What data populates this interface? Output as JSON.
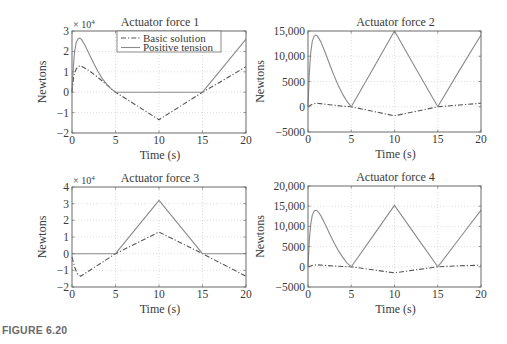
{
  "figure": {
    "caption": "FIGURE 6.20"
  },
  "chart_data": [
    {
      "type": "line",
      "title": "Actuator force 1",
      "xlabel": "Time (s)",
      "ylabel": "Newtons",
      "xlim": [
        0,
        20
      ],
      "ylim": [
        -20000,
        30000
      ],
      "y_multiplier": "× 10^4",
      "xticks": [
        0,
        5,
        10,
        15,
        20
      ],
      "yticks": [
        -2,
        -1,
        0,
        1,
        2,
        3
      ],
      "ytick_labels": [
        "−2",
        "−1",
        "0",
        "1",
        "2",
        "3"
      ],
      "grid": true,
      "legend": {
        "position": "top-right",
        "entries": [
          "Basic solution",
          "Positive tension"
        ]
      },
      "box": {
        "left": 72,
        "right": 246,
        "top": 31,
        "bottom": 133
      },
      "series": [
        {
          "name": "Basic solution",
          "style": "dashdot",
          "x": [
            0,
            0.2,
            0.5,
            0.8,
            1.0,
            2,
            3,
            4,
            5,
            7.5,
            10,
            12.5,
            15,
            17.5,
            20
          ],
          "y": [
            0,
            8000,
            11500,
            12800,
            13000,
            10500,
            7200,
            3600,
            0,
            -6700,
            -13500,
            -6700,
            0,
            6200,
            12500
          ]
        },
        {
          "name": "Positive tension",
          "style": "solid",
          "x": [
            0,
            0.15,
            0.3,
            0.5,
            0.7,
            0.9,
            1.1,
            1.5,
            2,
            2.5,
            3,
            3.5,
            4,
            4.5,
            5,
            10,
            15,
            17.5,
            20
          ],
          "y": [
            0,
            12000,
            20000,
            24500,
            26200,
            26500,
            25800,
            23000,
            18500,
            14000,
            10000,
            6500,
            3800,
            1600,
            0,
            0,
            0,
            13000,
            26000
          ]
        }
      ]
    },
    {
      "type": "line",
      "title": "Actuator force 2",
      "xlabel": "Time (s)",
      "ylabel": "Newtons",
      "xlim": [
        0,
        20
      ],
      "ylim": [
        -5000,
        15000
      ],
      "xticks": [
        0,
        5,
        10,
        15,
        20
      ],
      "yticks": [
        -5000,
        0,
        5000,
        10000,
        15000
      ],
      "ytick_labels": [
        "−5000",
        "0",
        "5000",
        "10,000",
        "15,000"
      ],
      "grid": true,
      "box": {
        "left": 308,
        "right": 481,
        "top": 31,
        "bottom": 132
      },
      "series": [
        {
          "name": "Basic solution",
          "style": "dashdot",
          "x": [
            0,
            0.5,
            1,
            2,
            3,
            4,
            5,
            7.5,
            10,
            12.5,
            15,
            17.5,
            20
          ],
          "y": [
            0,
            500,
            700,
            500,
            300,
            100,
            0,
            -900,
            -1800,
            -900,
            0,
            350,
            700
          ]
        },
        {
          "name": "Positive tension",
          "style": "solid",
          "x": [
            0,
            0.15,
            0.3,
            0.5,
            0.7,
            0.9,
            1.1,
            1.5,
            2,
            2.5,
            3,
            3.5,
            4,
            4.5,
            5,
            7.5,
            10,
            12.5,
            15,
            17.5,
            20
          ],
          "y": [
            0,
            6500,
            10500,
            13000,
            14000,
            14200,
            14000,
            12800,
            10700,
            8400,
            6200,
            4200,
            2500,
            1100,
            0,
            7500,
            15000,
            7500,
            0,
            7200,
            14200
          ]
        }
      ]
    },
    {
      "type": "line",
      "title": "Actuator force 3",
      "xlabel": "Time (s)",
      "ylabel": "Newtons",
      "xlim": [
        0,
        20
      ],
      "ylim": [
        -20000,
        40000
      ],
      "y_multiplier": "× 10^4",
      "xticks": [
        0,
        5,
        10,
        15,
        20
      ],
      "yticks": [
        -2,
        -1,
        0,
        1,
        2,
        3,
        4
      ],
      "ytick_labels": [
        "−2",
        "−1",
        "0",
        "1",
        "2",
        "3",
        "4"
      ],
      "grid": true,
      "box": {
        "left": 72,
        "right": 246,
        "top": 187,
        "bottom": 287
      },
      "series": [
        {
          "name": "Basic solution",
          "style": "dashdot",
          "x": [
            0,
            0.3,
            0.6,
            1.0,
            5,
            10,
            15,
            20
          ],
          "y": [
            -2000,
            -8000,
            -12000,
            -13500,
            0,
            13000,
            0,
            -13500
          ]
        },
        {
          "name": "Positive tension",
          "style": "solid",
          "x": [
            0,
            5,
            10,
            15,
            20
          ],
          "y": [
            0,
            0,
            32000,
            0,
            0
          ]
        }
      ]
    },
    {
      "type": "line",
      "title": "Actuator force 4",
      "xlabel": "Time (s)",
      "ylabel": "Newtons",
      "xlim": [
        0,
        20
      ],
      "ylim": [
        -5000,
        20000
      ],
      "xticks": [
        0,
        5,
        10,
        15,
        20
      ],
      "yticks": [
        -5000,
        0,
        5000,
        10000,
        15000,
        20000
      ],
      "ytick_labels": [
        "−5000",
        "0",
        "5000",
        "10,000",
        "15,000",
        "20,000"
      ],
      "grid": true,
      "box": {
        "left": 308,
        "right": 481,
        "top": 186,
        "bottom": 287
      },
      "series": [
        {
          "name": "Basic solution",
          "style": "dashdot",
          "x": [
            0,
            0.5,
            1,
            2,
            3,
            4,
            5,
            7.5,
            10,
            12.5,
            15,
            17.5,
            20
          ],
          "y": [
            0,
            350,
            500,
            350,
            200,
            80,
            0,
            -750,
            -1500,
            -750,
            0,
            250,
            400
          ]
        },
        {
          "name": "Positive tension",
          "style": "solid",
          "x": [
            0,
            0.15,
            0.3,
            0.5,
            0.7,
            0.9,
            1.1,
            1.5,
            2,
            2.5,
            3,
            3.5,
            4,
            4.5,
            5,
            7.5,
            10,
            12.5,
            15,
            17.5,
            20
          ],
          "y": [
            0,
            6500,
            10300,
            12800,
            13800,
            14000,
            13800,
            12600,
            10500,
            8200,
            6000,
            4000,
            2400,
            1000,
            0,
            7600,
            15200,
            7600,
            0,
            7000,
            14000
          ]
        }
      ]
    }
  ]
}
